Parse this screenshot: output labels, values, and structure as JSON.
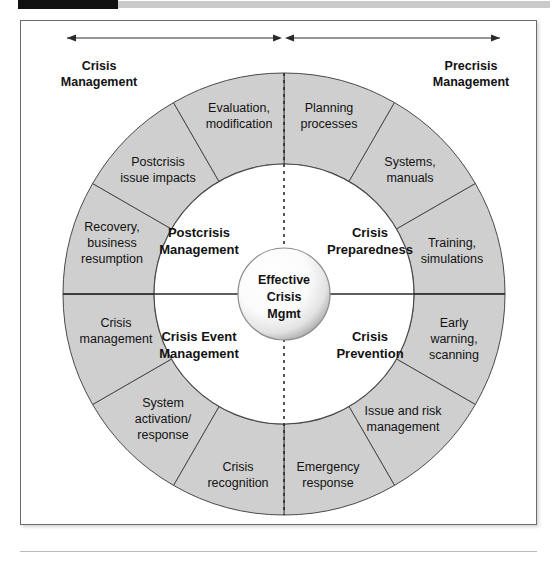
{
  "figure": {
    "title_bar": {
      "black_block": "",
      "gray_block": ""
    },
    "headers": [
      {
        "id": "left-header",
        "line1": "Crisis",
        "line2": "Management"
      },
      {
        "id": "right-header",
        "line1": "Precrisis",
        "line2": "Management"
      }
    ],
    "center": {
      "line1": "Effective",
      "line2": "Crisis",
      "line3": "Mgmt"
    },
    "quadrants": [
      {
        "id": "crisis-preparedness",
        "line1": "Crisis",
        "line2": "Preparedness"
      },
      {
        "id": "crisis-prevention",
        "line1": "Crisis",
        "line2": "Prevention"
      },
      {
        "id": "crisis-event-management",
        "line1": "Crisis Event",
        "line2": "Management"
      },
      {
        "id": "postcrisis-management",
        "line1": "Postcrisis",
        "line2": "Management"
      }
    ],
    "segments": [
      {
        "id": "planning-processes",
        "lines": [
          "Planning",
          "processes"
        ]
      },
      {
        "id": "systems-manuals",
        "lines": [
          "Systems,",
          "manuals"
        ]
      },
      {
        "id": "training-simulations",
        "lines": [
          "Training,",
          "simulations"
        ]
      },
      {
        "id": "early-warning-scanning",
        "lines": [
          "Early",
          "warning,",
          "scanning"
        ]
      },
      {
        "id": "issue-and-risk-management",
        "lines": [
          "Issue and risk",
          "management"
        ]
      },
      {
        "id": "emergency-response",
        "lines": [
          "Emergency",
          "response"
        ]
      },
      {
        "id": "crisis-recognition",
        "lines": [
          "Crisis",
          "recognition"
        ]
      },
      {
        "id": "system-activation-response",
        "lines": [
          "System",
          "activation/",
          "response"
        ]
      },
      {
        "id": "crisis-management-segment",
        "lines": [
          "Crisis",
          "management"
        ]
      },
      {
        "id": "recovery-business-resumption",
        "lines": [
          "Recovery,",
          "business",
          "resumption"
        ]
      },
      {
        "id": "postcrisis-issue-impacts",
        "lines": [
          "Postcrisis",
          "issue impacts"
        ]
      },
      {
        "id": "evaluation-modification",
        "lines": [
          "Evaluation,",
          "modification"
        ]
      }
    ],
    "colors": {
      "ring_fill": "#cfcfcf",
      "stroke": "#4a4a4a",
      "text": "#121212",
      "bar_black": "#111111",
      "bar_gray": "#cacaca"
    }
  }
}
